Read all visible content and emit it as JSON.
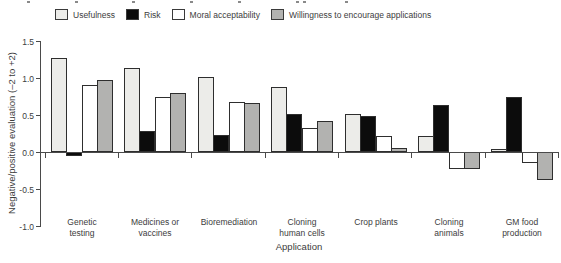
{
  "chart_data": {
    "type": "bar",
    "categories": [
      "Genetic testing",
      "Medicines or vaccines",
      "Bioremediation",
      "Cloning human cells",
      "Crop plants",
      "Cloning animals",
      "GM food production"
    ],
    "category_label_lines": [
      [
        "Genetic",
        "testing"
      ],
      [
        "Medicines or",
        "vaccines"
      ],
      [
        "Bioremediation"
      ],
      [
        "Cloning",
        "human cells"
      ],
      [
        "Crop plants"
      ],
      [
        "Cloning",
        "animals"
      ],
      [
        "GM food",
        "production"
      ]
    ],
    "series": [
      {
        "name": "Usefulness",
        "color": "#ecece9",
        "values": [
          1.27,
          1.14,
          1.02,
          0.88,
          0.52,
          0.21,
          0.04
        ]
      },
      {
        "name": "Risk",
        "color": "#0c0c0c",
        "values": [
          -0.05,
          0.28,
          0.23,
          0.52,
          0.48,
          0.63,
          0.74
        ]
      },
      {
        "name": "Moral acceptability",
        "color": "#ffffff",
        "values": [
          0.91,
          0.74,
          0.67,
          0.32,
          0.22,
          -0.23,
          -0.15
        ]
      },
      {
        "name": "Willingness to encourage applications",
        "color": "#b2b2b0",
        "values": [
          0.97,
          0.8,
          0.66,
          0.42,
          0.06,
          -0.23,
          -0.38
        ]
      }
    ],
    "xlabel": "Application",
    "ylabel": "Negative/positive evaluation (–2 to +2)",
    "ylim": [
      -1.0,
      1.5
    ],
    "yticks": [
      {
        "value": 1.5,
        "label": "1.5"
      },
      {
        "value": 1.0,
        "label": "1.0"
      },
      {
        "value": 0.5,
        "label": "0.5"
      },
      {
        "value": 0.0,
        "label": "0.0"
      },
      {
        "value": -0.5,
        "label": "-0.5"
      },
      {
        "value": -1.0,
        "label": "-1.0"
      }
    ],
    "legend_position": "top",
    "grid": false,
    "axis_color": "#4a4a4a",
    "bar_outline_color": "#2e2e2e",
    "text_color": "#3c3c3c"
  }
}
